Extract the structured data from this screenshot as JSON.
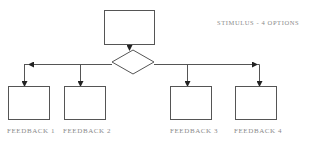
{
  "diagram": {
    "title": "Stimulus - 4 options",
    "annotation": "STIMULUS - 4 OPTIONS",
    "nodes": [
      {
        "id": "stimulus",
        "shape": "rectangle",
        "label": ""
      },
      {
        "id": "decision",
        "shape": "diamond",
        "label": ""
      },
      {
        "id": "feedback-1",
        "shape": "rectangle",
        "label": "FEEDBACK 1"
      },
      {
        "id": "feedback-2",
        "shape": "rectangle",
        "label": "FEEDBACK 2"
      },
      {
        "id": "feedback-3",
        "shape": "rectangle",
        "label": "FEEDBACK 3"
      },
      {
        "id": "feedback-4",
        "shape": "rectangle",
        "label": "FEEDBACK 4"
      }
    ],
    "edges": [
      {
        "from": "stimulus",
        "to": "decision"
      },
      {
        "from": "decision",
        "to": "feedback-1"
      },
      {
        "from": "decision",
        "to": "feedback-2"
      },
      {
        "from": "decision",
        "to": "feedback-3"
      },
      {
        "from": "decision",
        "to": "feedback-4"
      }
    ],
    "colors": {
      "stroke": "#555555",
      "arrow": "#222222",
      "label": "#8a8a8a"
    }
  }
}
